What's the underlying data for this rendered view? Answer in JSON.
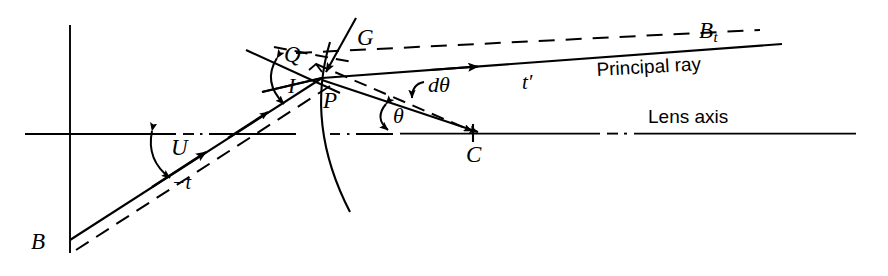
{
  "figure": {
    "type": "optical-ray-diagram",
    "background_color": "#ffffff",
    "line_color": "#000000",
    "width": 888,
    "height": 276
  },
  "labels": {
    "object_point": "B",
    "vertex_point": "P",
    "q_point": "Q",
    "normal": "G",
    "center_of_curvature": "C",
    "image_point_base": "B",
    "image_point_sub": "t",
    "principal_ray": "Principal ray",
    "lens_axis": "Lens axis",
    "object_distance": "−t",
    "image_distance_base": "t",
    "image_distance_prime": "′",
    "angle_u": "U",
    "angle_i": "I",
    "angle_theta": "θ",
    "angle_dtheta_d": "d",
    "angle_dtheta_theta": "θ"
  },
  "geometry": {
    "axis": {
      "x1": 25,
      "y1": 134,
      "x2": 856,
      "y2": 134
    },
    "vertical_line": {
      "x": 70,
      "y1": 25,
      "y2": 253
    },
    "point_B": {
      "x": 70,
      "y": 240
    },
    "point_P": {
      "x": 322,
      "y": 78
    },
    "point_Q": {
      "x": 304,
      "y": 62
    },
    "point_C": {
      "x": 473,
      "y": 133
    },
    "point_Bt": {
      "x": 782,
      "y": 44
    },
    "surface_arc": {
      "top_x": 330,
      "top_y": 42,
      "bottom_x": 350,
      "bottom_y": 212
    }
  },
  "notation": {
    "solid_lines": "real rays and lens surface",
    "dashed_lines": "construction / auxiliary lines",
    "dash_dot_line": "optical axis segments",
    "arrowheads": "direction of light propagation"
  }
}
